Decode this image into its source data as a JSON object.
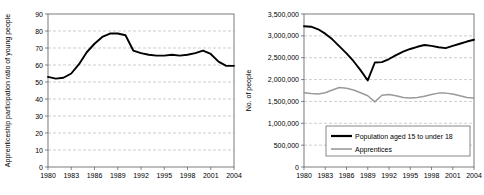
{
  "chart_data": [
    {
      "id": "apprenticeship-ratio",
      "type": "line",
      "title": "",
      "xlabel": "",
      "ylabel": "Apprenticeship participation ratio of young people",
      "xlim": [
        1980,
        2004
      ],
      "ylim": [
        0,
        90
      ],
      "ytick_step": 10,
      "yticks": [
        "0",
        "10",
        "20",
        "30",
        "40",
        "50",
        "60",
        "70",
        "80",
        "90"
      ],
      "xticks": [
        "1980",
        "1983",
        "1986",
        "1989",
        "1992",
        "1995",
        "1998",
        "2001",
        "2004"
      ],
      "grid": "horizontal-dashed",
      "legend": "none",
      "series": [
        {
          "name": "Apprenticeship participation ratio of young people",
          "color": "#000000",
          "x": [
            1980,
            1981,
            1982,
            1983,
            1984,
            1985,
            1986,
            1987,
            1988,
            1989,
            1990,
            1991,
            1992,
            1993,
            1994,
            1995,
            1996,
            1997,
            1998,
            1999,
            2000,
            2001,
            2002,
            2003,
            2004
          ],
          "values": [
            53.0,
            52.0,
            52.5,
            55.0,
            60.5,
            67.5,
            72.5,
            76.5,
            78.5,
            78.5,
            77.5,
            68.5,
            67.0,
            66.0,
            65.5,
            65.5,
            66.0,
            65.5,
            66.0,
            67.0,
            68.5,
            66.5,
            62.0,
            59.5,
            59.5
          ]
        }
      ]
    },
    {
      "id": "population-apprentices",
      "type": "line",
      "title": "",
      "xlabel": "",
      "ylabel": "No. of people",
      "xlim": [
        1980,
        2004
      ],
      "ylim": [
        0,
        3500000
      ],
      "ytick_step": 500000,
      "yticks": [
        "0",
        "500,000",
        "1,000,000",
        "1,500,000",
        "2,000,000",
        "2,500,000",
        "3,000,000",
        "3,500,000"
      ],
      "xticks": [
        "1980",
        "1983",
        "1986",
        "1989",
        "1992",
        "1995",
        "1998",
        "2001",
        "2004"
      ],
      "grid": "horizontal-dashed",
      "legend": "inside-bottom-center",
      "series": [
        {
          "name": "Population aged 15 to under 18",
          "color": "#000000",
          "x": [
            1980,
            1981,
            1982,
            1983,
            1984,
            1985,
            1986,
            1987,
            1988,
            1989,
            1990,
            1991,
            1992,
            1993,
            1994,
            1995,
            1996,
            1997,
            1998,
            1999,
            2000,
            2001,
            2002,
            2003,
            2004
          ],
          "values": [
            3220000,
            3210000,
            3150000,
            3050000,
            2920000,
            2760000,
            2600000,
            2420000,
            2210000,
            1980000,
            2390000,
            2400000,
            2470000,
            2560000,
            2640000,
            2700000,
            2750000,
            2790000,
            2770000,
            2740000,
            2720000,
            2770000,
            2820000,
            2870000,
            2910000
          ]
        },
        {
          "name": "Apprentices",
          "color": "#9a9a9a",
          "x": [
            1980,
            1981,
            1982,
            1983,
            1984,
            1985,
            1986,
            1987,
            1988,
            1989,
            1990,
            1991,
            1992,
            1993,
            1994,
            1995,
            1996,
            1997,
            1998,
            1999,
            2000,
            2001,
            2002,
            2003,
            2004
          ],
          "values": [
            1700000,
            1680000,
            1670000,
            1700000,
            1760000,
            1820000,
            1800000,
            1760000,
            1700000,
            1630000,
            1490000,
            1640000,
            1660000,
            1630000,
            1590000,
            1580000,
            1590000,
            1620000,
            1660000,
            1690000,
            1690000,
            1670000,
            1630000,
            1590000,
            1580000
          ]
        }
      ]
    }
  ],
  "left_chart": {
    "name": "Apprenticeship participation ratio chart",
    "ylabel": "Apprenticeship participation ratio of young people"
  },
  "right_chart": {
    "name": "Population and apprentices chart",
    "ylabel": "No. of people",
    "legend": {
      "items": [
        {
          "label": "Population aged 15 to under 18",
          "color": "#000000"
        },
        {
          "label": "Apprentices",
          "color": "#9a9a9a"
        }
      ]
    }
  }
}
